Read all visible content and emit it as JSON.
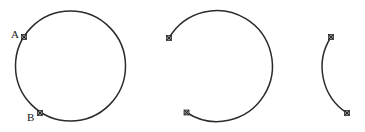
{
  "diagram": {
    "title": "",
    "colors": {
      "stroke": "#2b2b2b",
      "marker_fill": "#8a8a8a",
      "text": "#1a1a1a",
      "background": "#ffffff"
    },
    "figures": [
      {
        "id": "full-circle",
        "description": "Full circle with two labeled points A and B on its left side",
        "shape": "circle",
        "center": [
          70.5,
          66
        ],
        "radius": 55,
        "points": [
          {
            "label": "A",
            "x": 24,
            "y": 37
          },
          {
            "label": "B",
            "x": 40,
            "y": 113
          }
        ]
      },
      {
        "id": "major-arc",
        "description": "Major arc (circle with left gap) between two endpoints",
        "shape": "arc",
        "center": [
          215.5,
          66
        ],
        "radius": 55.5,
        "points": [
          {
            "label": "",
            "x": 169,
            "y": 38
          },
          {
            "label": "",
            "x": 186.5,
            "y": 112.5
          }
        ]
      },
      {
        "id": "minor-arc",
        "description": "Minor arc between two endpoints",
        "shape": "arc",
        "center": [
          376,
          68
        ],
        "radius": 55,
        "points": [
          {
            "label": "",
            "x": 331,
            "y": 37
          },
          {
            "label": "",
            "x": 347,
            "y": 113
          }
        ]
      }
    ],
    "labels": {
      "a": "A",
      "b": "B"
    }
  }
}
